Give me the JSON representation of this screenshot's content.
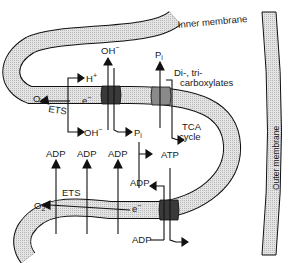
{
  "figure": {
    "membranes": {
      "inner": "Inner membrane",
      "outer": "Outer membrane"
    },
    "upper_labels": {
      "h_plus": "H",
      "h_plus_sup": "+",
      "oh_top": "OH",
      "oh_top_sup": "−",
      "pi_top": "P",
      "pi_top_sub": "i",
      "di_tri_1": "Di-, tri-",
      "di_tri_2": "carboxylates",
      "o2": "O",
      "o2_sub": "2",
      "ets": "ETS",
      "e_minus": "e",
      "e_minus_sup": "−",
      "oh_bottom": "OH",
      "oh_bottom_sup": "−",
      "pi_bottom": "P",
      "pi_bottom_sub": "i",
      "tca_1": "TCA",
      "tca_2": "cycle"
    },
    "lower_labels": {
      "adp_1": "ADP",
      "adp_2": "ADP",
      "adp_3": "ADP",
      "atp": "ATP",
      "adp_mid": "ADP",
      "o2": "O",
      "o2_sub": "2",
      "ets": "ETS",
      "e_minus": "e",
      "e_minus_sup": "−",
      "adp_bottom": "ADP"
    },
    "colors": {
      "membrane_fill": "#d6d6d6",
      "carrier_dark": "#3a3a3a",
      "carrier_medium": "#8a8a8a",
      "line": "#111111"
    }
  }
}
